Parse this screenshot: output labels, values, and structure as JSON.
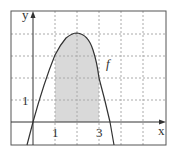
{
  "figure": {
    "axis_labels": {
      "x": "x",
      "y": "y"
    },
    "tick_labels": {
      "x1": "1",
      "x3": "3",
      "y1": "1"
    },
    "function_label": "f",
    "shaded_region": {
      "from_x": 1,
      "to_x": 3
    },
    "colors": {
      "frame": "#555555",
      "grid": "#aaaaaa",
      "curve": "#333333",
      "shade": "#d9d9d9"
    }
  }
}
